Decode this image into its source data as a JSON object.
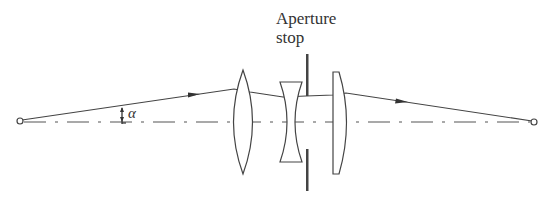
{
  "diagram": {
    "type": "optical-system-ray-diagram",
    "labels": {
      "aperture_line1": "Aperture",
      "aperture_line2": "stop",
      "angle": "α"
    },
    "elements": [
      {
        "name": "object-point",
        "kind": "point"
      },
      {
        "name": "biconvex-lens",
        "kind": "positive lens"
      },
      {
        "name": "biconcave-lens",
        "kind": "negative lens"
      },
      {
        "name": "aperture-stop",
        "kind": "stop"
      },
      {
        "name": "plano-convex-lens",
        "kind": "positive lens"
      },
      {
        "name": "image-point",
        "kind": "point"
      }
    ],
    "colors": {
      "line": "#444444",
      "background": "#ffffff"
    }
  }
}
